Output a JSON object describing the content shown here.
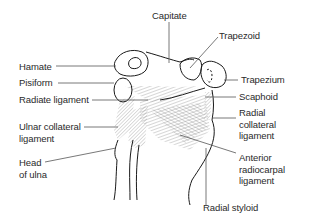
{
  "diagram": {
    "labels": {
      "capitate": "Capitate",
      "trapezoid": "Trapezoid",
      "hamate": "Hamate",
      "trapezium": "Trapezium",
      "pisiform": "Pisiform",
      "radiate_ligament": "Radiate ligament",
      "scaphoid": "Scaphoid",
      "ulnar_collateral_ligament": "Ulnar collateral\nligament",
      "radial_collateral_ligament": "Radial\ncollateral\nligament",
      "head_of_ulna": "Head\nof ulna",
      "anterior_radiocarpal_ligament": "Anterior\nradiocarpal\nligament",
      "radial_styloid": "Radial styloid"
    },
    "colors": {
      "line": "#1a1a1a",
      "leader": "#555555",
      "hatch": "#8a8a8a",
      "text": "#2a2a2a",
      "background": "#ffffff"
    }
  }
}
